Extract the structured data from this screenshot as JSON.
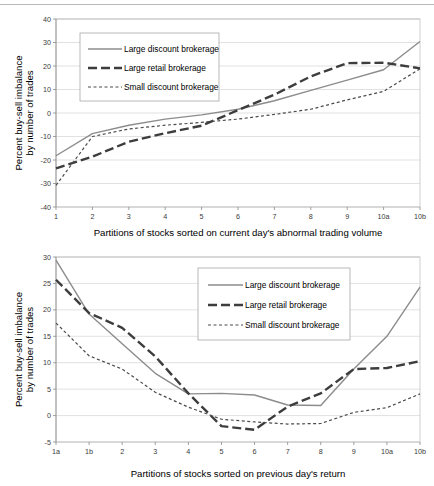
{
  "page": {
    "background": "#ffffff",
    "rule_color": "#b8b8b8"
  },
  "series_styles": {
    "large_discount": {
      "color": "#8c8c8c",
      "width": 1.4,
      "dash": "none"
    },
    "large_retail": {
      "color": "#3d3d3d",
      "width": 2.4,
      "dash": "9,4"
    },
    "small_discount": {
      "color": "#4a4a4a",
      "width": 1.2,
      "dash": "3,2.5"
    }
  },
  "chart_data": [
    {
      "id": "top",
      "type": "line",
      "title": "",
      "xlabel": "Partitions of stocks sorted on current day's abnormal trading volume",
      "ylabel": "Percent buy-sell imbalance by number of trades",
      "ylabel_line1": "Percent buy-sell imbalance",
      "ylabel_line2": "by number of trades",
      "categories": [
        "1",
        "2",
        "3",
        "4",
        "5",
        "6",
        "7",
        "8",
        "9",
        "10a",
        "10b"
      ],
      "yticks": [
        40,
        30,
        20,
        10,
        0,
        -10,
        -20,
        -30,
        -40
      ],
      "ylim": [
        -40,
        40
      ],
      "grid": true,
      "legend_position": "top-left",
      "series": [
        {
          "name": "Large discount brokerage",
          "key": "large_discount",
          "values": [
            -18.2,
            -8.8,
            -5.2,
            -2.6,
            -0.8,
            1.6,
            5.2,
            9.6,
            14.0,
            18.4,
            30.4
          ]
        },
        {
          "name": "Large retail brokerage",
          "key": "large_retail",
          "values": [
            -23.6,
            -18.6,
            -12.2,
            -8.6,
            -5.4,
            1.2,
            7.8,
            15.6,
            21.2,
            21.4,
            19.0
          ]
        },
        {
          "name": "Small discount brokerage",
          "key": "small_discount",
          "values": [
            -30.8,
            -10.0,
            -6.8,
            -5.2,
            -4.0,
            -2.6,
            -0.6,
            1.6,
            5.6,
            9.2,
            18.8
          ]
        }
      ]
    },
    {
      "id": "bottom",
      "type": "line",
      "title": "",
      "xlabel": "Partitions of stocks sorted on previous day's return",
      "ylabel": "Percent buy-sell imbalance by number of trades",
      "ylabel_line1": "Percent buy-sell imbalance",
      "ylabel_line2": "by number of trades",
      "categories": [
        "1a",
        "1b",
        "2",
        "3",
        "4",
        "5",
        "6",
        "7",
        "8",
        "9",
        "10a",
        "10b"
      ],
      "yticks": [
        30,
        25,
        20,
        15,
        10,
        5,
        0,
        -5
      ],
      "ylim": [
        -5,
        30
      ],
      "grid": true,
      "legend_position": "top-right",
      "series": [
        {
          "name": "Large discount brokerage",
          "key": "large_discount",
          "values": [
            29.4,
            19.2,
            13.6,
            8.0,
            4.1,
            4.2,
            3.9,
            2.0,
            1.9,
            8.8,
            15.0,
            24.3
          ]
        },
        {
          "name": "Large retail brokerage",
          "key": "large_retail",
          "values": [
            25.7,
            19.4,
            16.6,
            11.2,
            4.2,
            -2.0,
            -2.7,
            1.7,
            4.2,
            8.8,
            9.0,
            10.3
          ]
        },
        {
          "name": "Small discount brokerage",
          "key": "small_discount",
          "values": [
            17.5,
            11.3,
            8.8,
            4.4,
            1.6,
            -0.7,
            -1.2,
            -1.6,
            -1.5,
            0.6,
            1.5,
            4.1
          ]
        }
      ]
    }
  ]
}
